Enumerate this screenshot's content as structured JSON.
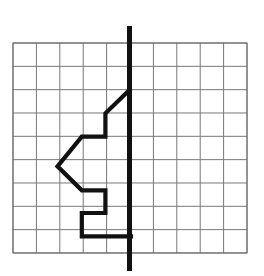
{
  "figure": {
    "background_color": "#ffffff",
    "width": 264,
    "height": 276,
    "grid": {
      "label": "square grid",
      "origin_x": 13,
      "origin_y": 43,
      "cell_width": 23.4,
      "cell_height": 23.33,
      "columns": 10,
      "rows": 9,
      "line_color": "#777777",
      "line_width": 1,
      "border_color": "#6b6b6b",
      "border_width": 1
    },
    "axis_line": {
      "label": "vertical line of reflection",
      "orientation": "vertical",
      "x": 129.5,
      "y_start": 26,
      "y_end": 271,
      "color": "#111111",
      "line_width": 5,
      "grid_column": 5
    },
    "polygon": {
      "label": "arrow-like polygon outline",
      "color": "#111111",
      "line_width": 4.2,
      "fill": "none",
      "closed": false,
      "points": [
        [
          129.5,
          90
        ],
        [
          105.4,
          113.3
        ],
        [
          105.4,
          136.6
        ],
        [
          81.8,
          136.6
        ],
        [
          57.5,
          166.3
        ],
        [
          81.8,
          190.3
        ],
        [
          105.4,
          190.3
        ],
        [
          105.4,
          213.0
        ],
        [
          81.8,
          213.0
        ],
        [
          81.8,
          236.3
        ],
        [
          131.0,
          236.3
        ]
      ],
      "grid_points": [
        [
          5,
          2
        ],
        [
          4,
          3
        ],
        [
          4,
          4
        ],
        [
          3,
          4
        ],
        [
          1.9,
          5.28
        ],
        [
          3,
          6.31
        ],
        [
          4,
          6.31
        ],
        [
          4,
          7.28
        ],
        [
          3,
          7.28
        ],
        [
          3,
          8.28
        ],
        [
          5,
          8.28
        ]
      ]
    }
  },
  "chart_data": {
    "type": "scatter",
    "xlabel": "",
    "ylabel": "",
    "xlim": [
      0,
      10
    ],
    "ylim": [
      0,
      9
    ],
    "grid": true,
    "legend": "none",
    "series": [
      {
        "name": "polygon outline",
        "x": [
          5,
          4,
          4,
          3,
          1.9,
          3,
          4,
          4,
          3,
          3,
          5
        ],
        "y": [
          7,
          6,
          5,
          5,
          3.72,
          2.69,
          2.69,
          1.72,
          1.72,
          0.72,
          0.72
        ]
      },
      {
        "name": "line of reflection",
        "x": [
          5,
          5
        ],
        "y": [
          9.7,
          -0.7
        ]
      }
    ]
  }
}
